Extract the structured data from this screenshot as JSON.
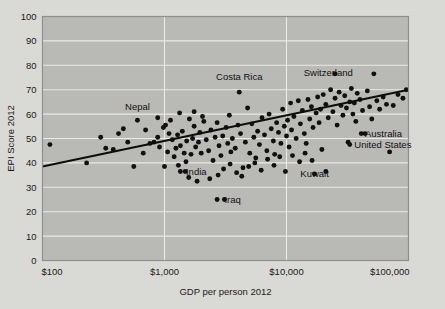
{
  "chart_data": {
    "type": "scatter",
    "title": "",
    "xlabel": "GDP per person 2012",
    "ylabel": "EPI Score 2012",
    "xscale": "log",
    "xlim": [
      100,
      100000
    ],
    "ylim": [
      0,
      100
    ],
    "grid": true,
    "legend": null,
    "xticks": [
      {
        "value": 100,
        "label": "$100"
      },
      {
        "value": 1000,
        "label": "$1,000"
      },
      {
        "value": 10000,
        "label": "$10,000"
      },
      {
        "value": 100000,
        "label": "$100,000"
      }
    ],
    "yticks": [
      {
        "value": 0,
        "label": "0"
      },
      {
        "value": 10,
        "label": "10"
      },
      {
        "value": 20,
        "label": "20"
      },
      {
        "value": 30,
        "label": "30"
      },
      {
        "value": 40,
        "label": "40"
      },
      {
        "value": 50,
        "label": "50"
      },
      {
        "value": 60,
        "label": "60"
      },
      {
        "value": 70,
        "label": "70"
      },
      {
        "value": 80,
        "label": "80"
      },
      {
        "value": 90,
        "label": "90"
      },
      {
        "value": 100,
        "label": "100"
      }
    ],
    "trendline": {
      "x0": 100,
      "y0": 38.5,
      "x1": 100000,
      "y1": 70.0,
      "color": "#0d0d0d"
    },
    "annotations": [
      {
        "label": "Nepal",
        "x": 600,
        "y": 63.0,
        "anchor": "middle"
      },
      {
        "label": "Costa Rica",
        "x": 4100,
        "y": 75.5,
        "anchor": "middle"
      },
      {
        "label": "Switzerland",
        "x": 22000,
        "y": 77.0,
        "anchor": "middle"
      },
      {
        "label": "Australia",
        "x": 44000,
        "y": 52.0,
        "anchor": "start"
      },
      {
        "label": "United States",
        "x": 36000,
        "y": 47.5,
        "anchor": "start"
      },
      {
        "label": "Kuwait",
        "x": 17000,
        "y": 35.5,
        "anchor": "middle"
      },
      {
        "label": "India",
        "x": 1500,
        "y": 36.5,
        "anchor": "start"
      },
      {
        "label": "Iraq",
        "x": 3100,
        "y": 25.0,
        "anchor": "start"
      }
    ],
    "points": [
      [
        115,
        47.5
      ],
      [
        230,
        40.0
      ],
      [
        300,
        50.5
      ],
      [
        330,
        46.0
      ],
      [
        380,
        45.5
      ],
      [
        460,
        54.0
      ],
      [
        500,
        48.5
      ],
      [
        560,
        38.5
      ],
      [
        700,
        53.5
      ],
      [
        760,
        48.0
      ],
      [
        820,
        48.5
      ],
      [
        880,
        50.5
      ],
      [
        910,
        46.5
      ],
      [
        980,
        54.5
      ],
      [
        1000,
        38.5
      ],
      [
        1020,
        55.5
      ],
      [
        1060,
        44.5
      ],
      [
        1090,
        52.0
      ],
      [
        1120,
        57.5
      ],
      [
        1160,
        49.5
      ],
      [
        1200,
        42.5
      ],
      [
        1240,
        46.0
      ],
      [
        1280,
        51.5
      ],
      [
        1300,
        39.0
      ],
      [
        1350,
        47.0
      ],
      [
        1400,
        53.0
      ],
      [
        1450,
        44.0
      ],
      [
        1480,
        36.5
      ],
      [
        1500,
        40.5
      ],
      [
        1520,
        49.0
      ],
      [
        1600,
        58.0
      ],
      [
        1650,
        43.5
      ],
      [
        1700,
        50.0
      ],
      [
        1750,
        55.0
      ],
      [
        1800,
        46.5
      ],
      [
        1850,
        32.5
      ],
      [
        1900,
        48.5
      ],
      [
        1950,
        52.5
      ],
      [
        2000,
        44.0
      ],
      [
        2100,
        57.0
      ],
      [
        2200,
        49.5
      ],
      [
        2300,
        45.0
      ],
      [
        2400,
        53.5
      ],
      [
        2500,
        41.0
      ],
      [
        2600,
        50.5
      ],
      [
        2700,
        56.5
      ],
      [
        2800,
        47.0
      ],
      [
        2900,
        43.0
      ],
      [
        3000,
        51.0
      ],
      [
        3100,
        25.0
      ],
      [
        3200,
        54.5
      ],
      [
        3300,
        48.0
      ],
      [
        3400,
        59.5
      ],
      [
        3500,
        44.5
      ],
      [
        3600,
        50.0
      ],
      [
        3800,
        46.0
      ],
      [
        4000,
        55.5
      ],
      [
        4200,
        52.0
      ],
      [
        4400,
        38.0
      ],
      [
        4600,
        48.5
      ],
      [
        4800,
        62.5
      ],
      [
        5000,
        44.0
      ],
      [
        5200,
        56.0
      ],
      [
        5400,
        50.5
      ],
      [
        5600,
        42.0
      ],
      [
        5800,
        53.0
      ],
      [
        6000,
        47.5
      ],
      [
        6300,
        58.5
      ],
      [
        6600,
        51.5
      ],
      [
        6900,
        45.0
      ],
      [
        7200,
        60.0
      ],
      [
        7500,
        54.0
      ],
      [
        7800,
        49.0
      ],
      [
        8000,
        43.5
      ],
      [
        8300,
        56.5
      ],
      [
        8600,
        52.5
      ],
      [
        9000,
        48.0
      ],
      [
        9300,
        62.0
      ],
      [
        9600,
        55.0
      ],
      [
        10000,
        51.0
      ],
      [
        10200,
        57.5
      ],
      [
        10500,
        46.5
      ],
      [
        10800,
        64.5
      ],
      [
        11000,
        53.5
      ],
      [
        11500,
        59.0
      ],
      [
        12000,
        50.0
      ],
      [
        12500,
        65.5
      ],
      [
        13000,
        56.0
      ],
      [
        13500,
        61.5
      ],
      [
        14000,
        52.0
      ],
      [
        14500,
        48.0
      ],
      [
        15000,
        66.0
      ],
      [
        15500,
        58.0
      ],
      [
        16000,
        63.0
      ],
      [
        16500,
        54.5
      ],
      [
        17000,
        35.5
      ],
      [
        17500,
        60.5
      ],
      [
        18000,
        67.0
      ],
      [
        18500,
        56.5
      ],
      [
        19000,
        62.0
      ],
      [
        20000,
        68.0
      ],
      [
        21000,
        64.0
      ],
      [
        22000,
        58.5
      ],
      [
        23000,
        70.0
      ],
      [
        24000,
        61.0
      ],
      [
        25000,
        66.5
      ],
      [
        26000,
        55.5
      ],
      [
        27000,
        69.0
      ],
      [
        28000,
        63.5
      ],
      [
        29000,
        59.5
      ],
      [
        30000,
        67.5
      ],
      [
        31000,
        62.5
      ],
      [
        32000,
        48.5
      ],
      [
        33000,
        65.0
      ],
      [
        34000,
        70.5
      ],
      [
        35000,
        60.0
      ],
      [
        36000,
        64.5
      ],
      [
        37000,
        57.0
      ],
      [
        38000,
        68.5
      ],
      [
        40000,
        66.0
      ],
      [
        42000,
        61.5
      ],
      [
        44000,
        52.0
      ],
      [
        46000,
        69.5
      ],
      [
        48000,
        63.0
      ],
      [
        50000,
        58.0
      ],
      [
        52000,
        76.5
      ],
      [
        55000,
        65.5
      ],
      [
        58000,
        62.0
      ],
      [
        62000,
        67.0
      ],
      [
        66000,
        64.0
      ],
      [
        70000,
        44.5
      ],
      [
        75000,
        63.5
      ],
      [
        82000,
        68.0
      ],
      [
        90000,
        66.5
      ],
      [
        96000,
        70.0
      ],
      [
        1750,
        61.0
      ],
      [
        2050,
        59.0
      ],
      [
        2350,
        33.5
      ],
      [
        2750,
        35.0
      ],
      [
        3050,
        37.5
      ],
      [
        3450,
        39.5
      ],
      [
        3900,
        36.0
      ],
      [
        4300,
        34.5
      ],
      [
        4900,
        38.5
      ],
      [
        5500,
        40.0
      ],
      [
        6200,
        37.0
      ],
      [
        7000,
        41.5
      ],
      [
        7900,
        39.0
      ],
      [
        8800,
        42.5
      ],
      [
        9800,
        36.5
      ],
      [
        11200,
        43.0
      ],
      [
        12800,
        40.5
      ],
      [
        14200,
        44.0
      ],
      [
        16200,
        41.0
      ],
      [
        19500,
        45.5
      ],
      [
        1330,
        60.5
      ],
      [
        1580,
        34.0
      ],
      [
        880,
        58.5
      ],
      [
        670,
        44.0
      ],
      [
        420,
        52.0
      ]
    ]
  }
}
